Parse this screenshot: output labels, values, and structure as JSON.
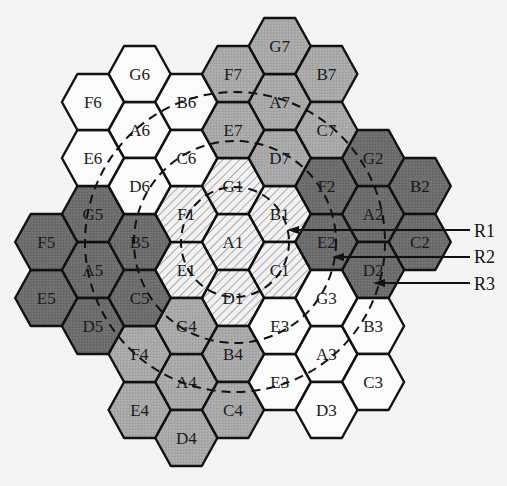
{
  "diagram": {
    "center": {
      "x": 233,
      "y": 242
    },
    "col_spacing": 46.7,
    "half_row": 28,
    "hex_radius": 31,
    "colors": {
      "background": "#f4f4f4",
      "stroke": "#111111",
      "white": "#fbfbfb",
      "medium": "#a9a9a9",
      "dark": "#6d6d6d",
      "hatch_bg": "#f2f2f2",
      "hatch_line": "#777777",
      "dash": "#111111"
    },
    "clusters": [
      {
        "id": 1,
        "fill": "hatch",
        "cells": [
          {
            "label": "A1",
            "c": 0,
            "h": 0
          },
          {
            "label": "G1",
            "c": 0,
            "h": -2
          },
          {
            "label": "B1",
            "c": 1,
            "h": -1
          },
          {
            "label": "C1",
            "c": 1,
            "h": 1
          },
          {
            "label": "D1",
            "c": 0,
            "h": 2
          },
          {
            "label": "E1",
            "c": -1,
            "h": 1
          },
          {
            "label": "F1",
            "c": -1,
            "h": -1
          }
        ]
      },
      {
        "id": 2,
        "fill": "dark",
        "cells": [
          {
            "label": "A2",
            "c": 3,
            "h": -1
          },
          {
            "label": "G2",
            "c": 3,
            "h": -3
          },
          {
            "label": "B2",
            "c": 4,
            "h": -2
          },
          {
            "label": "C2",
            "c": 4,
            "h": 0
          },
          {
            "label": "D2",
            "c": 3,
            "h": 1
          },
          {
            "label": "E2",
            "c": 2,
            "h": 0
          },
          {
            "label": "F2",
            "c": 2,
            "h": -2
          }
        ]
      },
      {
        "id": 3,
        "fill": "white",
        "cells": [
          {
            "label": "A3",
            "c": 2,
            "h": 4
          },
          {
            "label": "G3",
            "c": 2,
            "h": 2
          },
          {
            "label": "B3",
            "c": 3,
            "h": 3
          },
          {
            "label": "C3",
            "c": 3,
            "h": 5
          },
          {
            "label": "D3",
            "c": 2,
            "h": 6
          },
          {
            "label": "E3",
            "c": 1,
            "h": 5
          },
          {
            "label": "E3",
            "c": 1,
            "h": 3
          }
        ]
      },
      {
        "id": 4,
        "fill": "medium",
        "cells": [
          {
            "label": "A4",
            "c": -1,
            "h": 5
          },
          {
            "label": "G4",
            "c": -1,
            "h": 3
          },
          {
            "label": "B4",
            "c": 0,
            "h": 4
          },
          {
            "label": "C4",
            "c": 0,
            "h": 6
          },
          {
            "label": "D4",
            "c": -1,
            "h": 7
          },
          {
            "label": "E4",
            "c": -2,
            "h": 6
          },
          {
            "label": "F4",
            "c": -2,
            "h": 4
          }
        ]
      },
      {
        "id": 5,
        "fill": "dark",
        "cells": [
          {
            "label": "A5",
            "c": -3,
            "h": 1
          },
          {
            "label": "G5",
            "c": -3,
            "h": -1
          },
          {
            "label": "B5",
            "c": -2,
            "h": 0
          },
          {
            "label": "C5",
            "c": -2,
            "h": 2
          },
          {
            "label": "D5",
            "c": -3,
            "h": 3
          },
          {
            "label": "E5",
            "c": -4,
            "h": 2
          },
          {
            "label": "F5",
            "c": -4,
            "h": 0
          }
        ]
      },
      {
        "id": 6,
        "fill": "white",
        "cells": [
          {
            "label": "A6",
            "c": -2,
            "h": -4
          },
          {
            "label": "G6",
            "c": -2,
            "h": -6
          },
          {
            "label": "B6",
            "c": -1,
            "h": -5
          },
          {
            "label": "C6",
            "c": -1,
            "h": -3
          },
          {
            "label": "D6",
            "c": -2,
            "h": -2
          },
          {
            "label": "E6",
            "c": -3,
            "h": -3
          },
          {
            "label": "F6",
            "c": -3,
            "h": -5
          }
        ]
      },
      {
        "id": 7,
        "fill": "medium",
        "cells": [
          {
            "label": "A7",
            "c": 1,
            "h": -5
          },
          {
            "label": "G7",
            "c": 1,
            "h": -7
          },
          {
            "label": "B7",
            "c": 2,
            "h": -6
          },
          {
            "label": "C7",
            "c": 2,
            "h": -4
          },
          {
            "label": "D7",
            "c": 1,
            "h": -3
          },
          {
            "label": "E7",
            "c": 0,
            "h": -4
          },
          {
            "label": "F7",
            "c": 0,
            "h": -6
          }
        ]
      }
    ],
    "rings": [
      {
        "label": "R1",
        "rx": 54,
        "ry": 55,
        "arrow_tip": {
          "x": 287,
          "y": 230
        },
        "label_pos": {
          "x": 474,
          "y": 231
        }
      },
      {
        "label": "R2",
        "rx": 101,
        "ry": 101,
        "arrow_tip": {
          "x": 332,
          "y": 257
        },
        "label_pos": {
          "x": 474,
          "y": 257
        }
      },
      {
        "label": "R3",
        "rx": 150,
        "ry": 150,
        "arrow_tip": {
          "x": 373,
          "y": 283
        },
        "label_pos": {
          "x": 474,
          "y": 284
        }
      }
    ]
  }
}
